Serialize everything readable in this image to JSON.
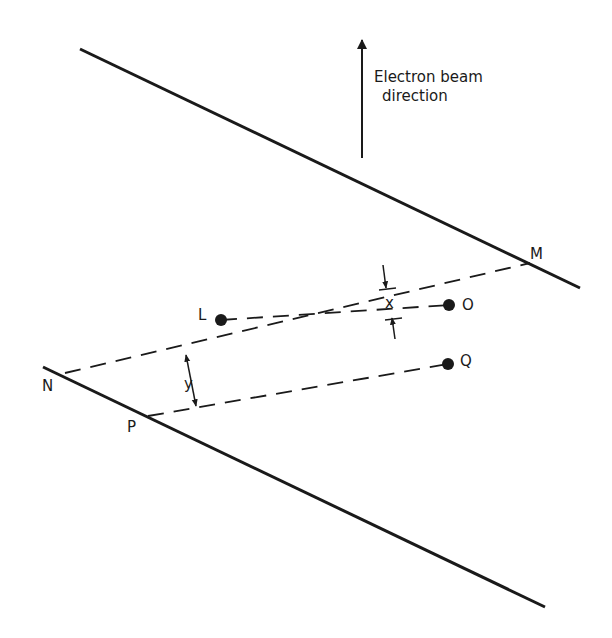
{
  "diagram": {
    "caption": {
      "line1": "Electron beam",
      "line2": "direction"
    },
    "points": {
      "L": "L",
      "O": "O",
      "Q": "Q",
      "M": "M",
      "N": "N",
      "P": "P"
    },
    "dimensions": {
      "x": "x",
      "y": "y"
    },
    "colors": {
      "ink": "#1a1a1a",
      "background": "#ffffff"
    }
  }
}
